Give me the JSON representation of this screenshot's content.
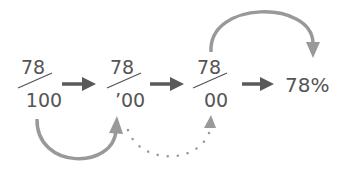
{
  "colors": {
    "text": "#555555",
    "straight_arrow": "#5a5a5a",
    "curved_arrow": "#999999",
    "dotted_arrow": "#999999",
    "slash": "#555555"
  },
  "steps": [
    {
      "numerator": "78",
      "denominator": "100"
    },
    {
      "numerator": "78",
      "denominator": "’00"
    },
    {
      "numerator": "78",
      "denominator": "00"
    }
  ],
  "result": "78%",
  "arrows": {
    "straight": [
      "arrow-right-icon",
      "arrow-right-icon",
      "arrow-right-icon"
    ],
    "curved_bottom": "curved-up-arrow-icon",
    "dotted_bottom": "dotted-curved-arrow-icon",
    "curved_top": "curved-down-arrow-icon"
  }
}
